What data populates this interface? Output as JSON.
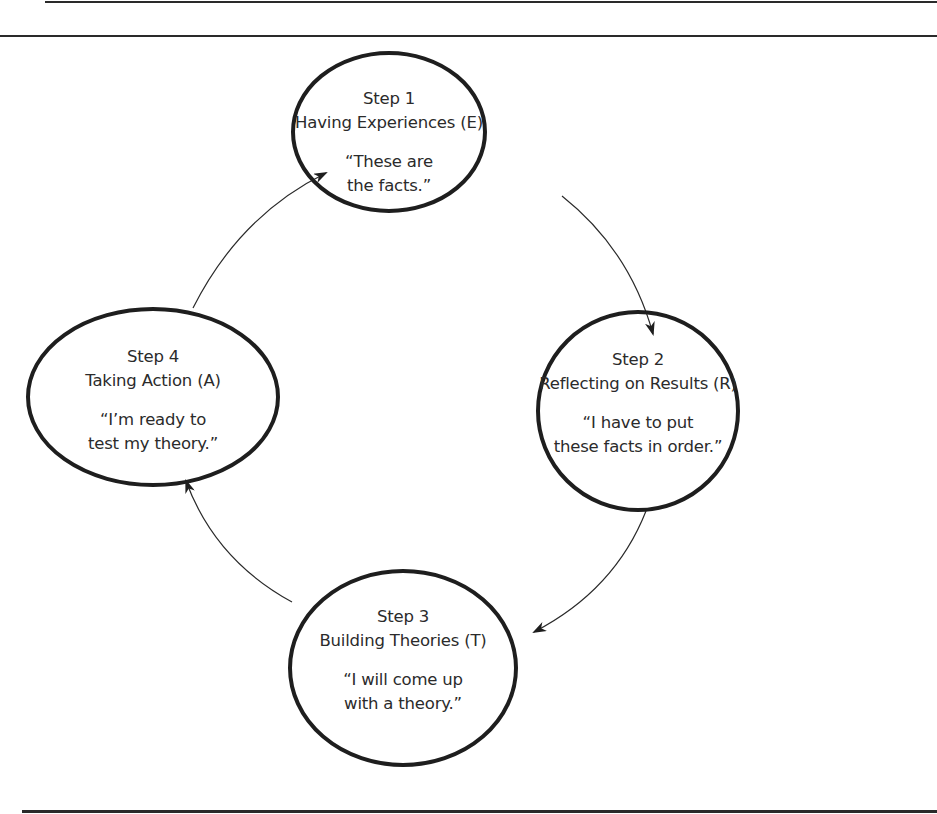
{
  "diagram": {
    "type": "cycle",
    "colors": {
      "stroke": "#1e1e1e",
      "text": "#2b2b2b",
      "background": "#ffffff"
    },
    "steps": [
      {
        "id": "E",
        "step": "Step 1",
        "title": "Having Experiences (E)",
        "quote_line1": "“These are",
        "quote_line2": "the facts.”"
      },
      {
        "id": "R",
        "step": "Step 2",
        "title": "Reflecting on Results (R)",
        "quote_line1": "“I have to put",
        "quote_line2": "these facts in order.”"
      },
      {
        "id": "T",
        "step": "Step 3",
        "title": "Building Theories (T)",
        "quote_line1": "“I will come up",
        "quote_line2": "with a theory.”"
      },
      {
        "id": "A",
        "step": "Step 4",
        "title": "Taking Action (A)",
        "quote_line1": "“I’m ready to",
        "quote_line2": "test my theory.”"
      }
    ],
    "edges": [
      {
        "from": "Step 1",
        "to": "Step 2"
      },
      {
        "from": "Step 2",
        "to": "Step 3"
      },
      {
        "from": "Step 3",
        "to": "Step 4"
      },
      {
        "from": "Step 4",
        "to": "Step 1"
      }
    ]
  }
}
